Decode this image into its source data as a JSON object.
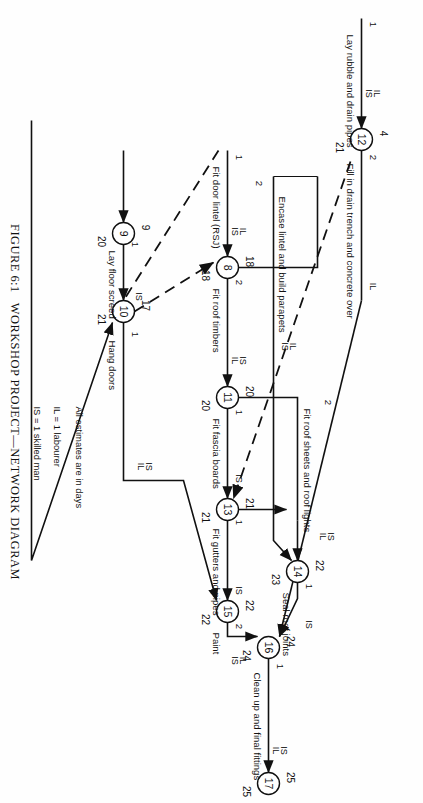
{
  "figure": {
    "number": "FIGURE 6:1",
    "title": "WORKSHOP PROJECT—NETWORK DIAGRAM"
  },
  "legend": {
    "line1": "All estimates are in days",
    "line2": "IL = 1 labourer",
    "line3": "IS = 1 skilled man"
  },
  "nodes": [
    {
      "id": "n12",
      "label": "12",
      "early": "4",
      "late": "21"
    },
    {
      "id": "n8",
      "label": "8",
      "early": "18",
      "late": "18"
    },
    {
      "id": "n9",
      "label": "9",
      "early": "9",
      "late": "20"
    },
    {
      "id": "n10",
      "label": "10",
      "early": "17",
      "late": "21"
    },
    {
      "id": "n11",
      "label": "11",
      "early": "20",
      "late": "20"
    },
    {
      "id": "n13",
      "label": "13",
      "early": "21",
      "late": "21"
    },
    {
      "id": "n14",
      "label": "14",
      "early": "22",
      "late": "23"
    },
    {
      "id": "n15",
      "label": "15",
      "early": "22",
      "late": "22"
    },
    {
      "id": "n16",
      "label": "16",
      "early": "24",
      "late": "24"
    },
    {
      "id": "n17",
      "label": "17",
      "early": "25",
      "late": "25"
    }
  ],
  "activities": [
    {
      "id": "a-rubble",
      "name": "Lay rubble and drain pipes",
      "duration": "1",
      "res1": "IL",
      "res2": "IS"
    },
    {
      "id": "a-fill",
      "name": "Fill in drain trench and concrete over",
      "duration": "2",
      "res1": "IL",
      "res2": ""
    },
    {
      "id": "a-lintel",
      "name": "Fit door lintel (RSJ)",
      "duration": "1",
      "res1": "IL",
      "res2": "IS"
    },
    {
      "id": "a-timbers",
      "name": "Fit roof timbers",
      "duration": "2",
      "res1": "IS",
      "res2": "IL"
    },
    {
      "id": "a-encase",
      "name": "Encase lintel and build parapets",
      "duration": "2",
      "res1": "IS",
      "res2": "IL"
    },
    {
      "id": "a-fascia",
      "name": "Fit fascia boards",
      "duration": "1",
      "res1": "IS",
      "res2": ""
    },
    {
      "id": "a-sheets",
      "name": "Fit roof sheets and roof lights",
      "duration": "2",
      "res1": "IS",
      "res2": "IL"
    },
    {
      "id": "a-gutters",
      "name": "Fit gutters and pipes",
      "duration": "1",
      "res1": "IS",
      "res2": ""
    },
    {
      "id": "a-seal",
      "name": "Seal roof joints",
      "duration": "1",
      "res1": "IS",
      "res2": ""
    },
    {
      "id": "a-screed",
      "name": "Lay floor screed",
      "duration": "1",
      "res1": "IS",
      "res2": ""
    },
    {
      "id": "a-hang",
      "name": "Hang doors",
      "duration": "1",
      "res1": "IS",
      "res2": "IL"
    },
    {
      "id": "a-paint",
      "name": "Paint",
      "duration": "2",
      "res1": "IL",
      "res2": "IS"
    },
    {
      "id": "a-clean",
      "name": "Clean up and final fittings",
      "duration": "1",
      "res1": "IS",
      "res2": "IL"
    }
  ],
  "colors": {
    "ink": "#111111",
    "paper": "#fefefe"
  }
}
